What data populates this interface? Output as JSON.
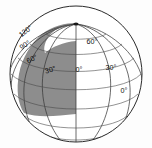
{
  "figure": {
    "name": "globe-graticule-diagram",
    "background_color": "#fdfdfd",
    "shade_color": "#8d8d8d",
    "line_color": "#3a3a3a",
    "face_color": "#ffffff"
  },
  "labels": {
    "left_meridians": [
      {
        "text": "120°",
        "x": 27,
        "y": 33,
        "rotate": -38
      },
      {
        "text": "90°",
        "x": 26,
        "y": 47,
        "rotate": -32
      },
      {
        "text": "60°",
        "x": 33,
        "y": 61,
        "rotate": -26
      },
      {
        "text": "30°",
        "x": 51,
        "y": 72,
        "rotate": -18
      }
    ],
    "center_meridian": {
      "text": "0°",
      "x": 76,
      "y": 72,
      "rotate": 0
    },
    "right_meridians": [
      {
        "text": "60°",
        "x": 92,
        "y": 44,
        "rotate": 0
      },
      {
        "text": "30°",
        "x": 111,
        "y": 70,
        "rotate": 0
      },
      {
        "text": "0°",
        "x": 124,
        "y": 93,
        "rotate": 0
      }
    ]
  },
  "geometry": {
    "center_x": 76,
    "center_y": 74,
    "radius_x": 67,
    "radius_y": 69,
    "pole_x": 76,
    "pole_y": 25
  }
}
